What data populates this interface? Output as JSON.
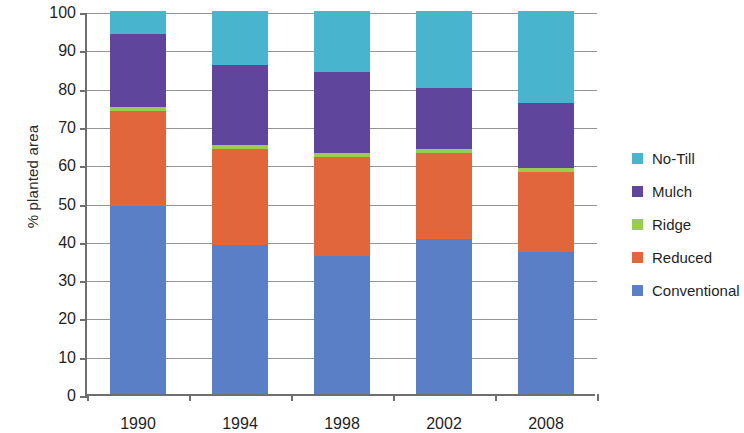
{
  "chart_data": {
    "type": "bar",
    "title": "",
    "subtitle": "",
    "stacked": true,
    "xlabel": "",
    "ylabel": "% planted area",
    "ylim": [
      0,
      100
    ],
    "ytick_step": 10,
    "yticks": [
      0,
      10,
      20,
      30,
      40,
      50,
      60,
      70,
      80,
      90,
      100
    ],
    "grid": true,
    "legend_position": "right",
    "categories": [
      "1990",
      "1994",
      "1998",
      "2002",
      "2008"
    ],
    "series": [
      {
        "name": "Conventional",
        "color": "#5b7fc7",
        "values": [
          49,
          39,
          36,
          40.5,
          37
        ]
      },
      {
        "name": "Reduced",
        "color": "#e2663c",
        "values": [
          25,
          25,
          26,
          22.5,
          21
        ]
      },
      {
        "name": "Ridge",
        "color": "#9acd4f",
        "values": [
          1,
          1,
          1,
          1,
          1
        ]
      },
      {
        "name": "Mulch",
        "color": "#60459c",
        "values": [
          19,
          21,
          21,
          16,
          17
        ]
      },
      {
        "name": "No-Till",
        "color": "#48b4cd",
        "values": [
          6,
          14,
          16,
          20,
          24
        ]
      }
    ],
    "stack_order_bottom_to_top": [
      "Conventional",
      "Reduced",
      "Ridge",
      "Mulch",
      "No-Till"
    ],
    "legend_order_top_to_bottom": [
      "No-Till",
      "Mulch",
      "Ridge",
      "Reduced",
      "Conventional"
    ]
  },
  "axis": {
    "y_title": "% planted area",
    "y_tick_labels": [
      "100",
      "90",
      "80",
      "70",
      "60",
      "50",
      "40",
      "30",
      "20",
      "10",
      "0"
    ],
    "x_tick_labels": [
      "1990",
      "1994",
      "1998",
      "2002",
      "2008"
    ]
  },
  "legend": {
    "entries": [
      {
        "label": "No-Till",
        "color": "#48b4cd"
      },
      {
        "label": "Mulch",
        "color": "#60459c"
      },
      {
        "label": "Ridge",
        "color": "#9acd4f"
      },
      {
        "label": "Reduced",
        "color": "#e2663c"
      },
      {
        "label": "Conventional",
        "color": "#5b7fc7"
      }
    ]
  }
}
